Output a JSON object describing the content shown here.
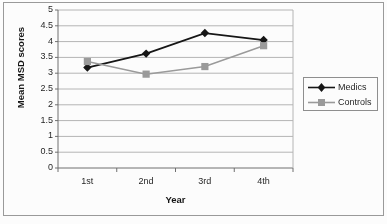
{
  "chart_data": {
    "type": "line",
    "title": "",
    "xlabel": "Year",
    "ylabel": "Mean MSD scores",
    "categories": [
      "1st",
      "2nd",
      "3rd",
      "4th"
    ],
    "ylim": [
      0,
      5
    ],
    "ytick_labels": [
      "0",
      "0.5",
      "1",
      "1.5",
      "2",
      "2.5",
      "3",
      "3.5",
      "4",
      "4.5",
      "5"
    ],
    "ytick_values": [
      0,
      0.5,
      1,
      1.5,
      2,
      2.5,
      3,
      3.5,
      4,
      4.5,
      5
    ],
    "grid": "horizontal",
    "legend_position": "right",
    "series": [
      {
        "name": "Medics",
        "values": [
          3.18,
          3.62,
          4.27,
          4.05
        ],
        "color": "#111111",
        "marker": "diamond"
      },
      {
        "name": "Controls",
        "values": [
          3.37,
          2.97,
          3.21,
          3.87
        ],
        "color": "#9a9a9a",
        "marker": "square"
      }
    ]
  },
  "legend": {
    "items": [
      {
        "label": "Medics",
        "marker_icon": "diamond-marker-icon"
      },
      {
        "label": "Controls",
        "marker_icon": "square-marker-icon"
      }
    ]
  },
  "colors": {
    "medics": "#111111",
    "controls": "#9a9a9a",
    "grid": "#b4b4b4",
    "axis": "#6d6d6d",
    "frame": "#9a9a9a",
    "background": "#ffffff",
    "text": "#1c1c1c"
  }
}
